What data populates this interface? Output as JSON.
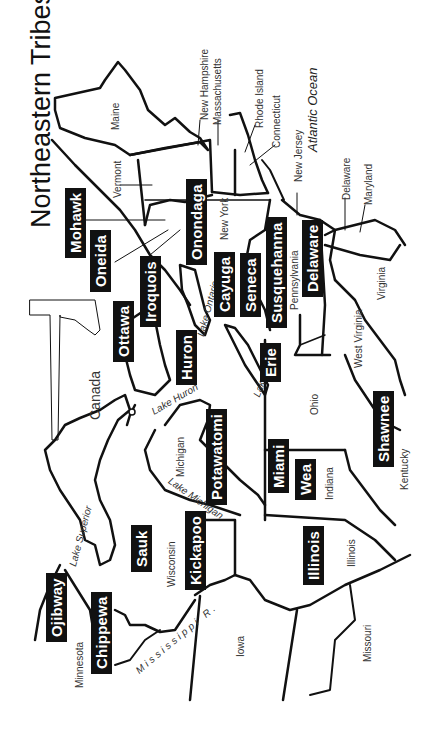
{
  "title": "Northeastern Tribes",
  "icon": "tomahawk-icon",
  "colors": {
    "background": "#ffffff",
    "ink": "#111111",
    "tribe_label_bg": "#111111",
    "tribe_label_text": "#ffffff"
  },
  "orientation": "rotated 90deg counter-clockwise (text reads bottom-to-top)",
  "water": {
    "ocean": "Atlantic Ocean",
    "lakes": [
      "Lake Superior",
      "Lake Michigan",
      "Lake Huron",
      "Lake Erie",
      "Lake Ontario"
    ],
    "river": "Mississippi R."
  },
  "states": {
    "maine": "Maine",
    "new_hampshire": "New Hampshire",
    "massachusetts": "Massachusetts",
    "rhode_island": "Rhode Island",
    "connecticut": "Connecticut",
    "vermont": "Vermont",
    "new_york": "New York",
    "new_jersey": "New Jersey",
    "delaware": "Delaware",
    "maryland": "Maryland",
    "pennsylvania": "Pennsylvania",
    "virginia": "Virginia",
    "west_virginia": "West Virginia",
    "ohio": "Ohio",
    "kentucky": "Kentucky",
    "michigan": "Michigan",
    "indiana": "Indiana",
    "illinois": "Illinois",
    "wisconsin": "Wisconsin",
    "minnesota": "Minnesota",
    "iowa": "Iowa",
    "missouri": "Missouri",
    "canada": "Canada"
  },
  "tribes": {
    "mohawk": "Mohawk",
    "oneida": "Oneida",
    "onondaga": "Onondaga",
    "iroquois": "Iroquois",
    "ottawa": "Ottawa",
    "cayuga": "Cayuga",
    "seneca": "Seneca",
    "susquehanna": "Susquehanna",
    "delaware": "Delaware",
    "huron": "Huron",
    "erie": "Erie",
    "potawatomi": "Potawatomi",
    "miami": "Miami",
    "wea": "Wea",
    "shawnee": "Shawnee",
    "illinois": "Illinois",
    "kickapoo": "Kickapoo",
    "sauk": "Sauk",
    "ojibway": "Ojibway",
    "chippewa": "Chippewa"
  }
}
